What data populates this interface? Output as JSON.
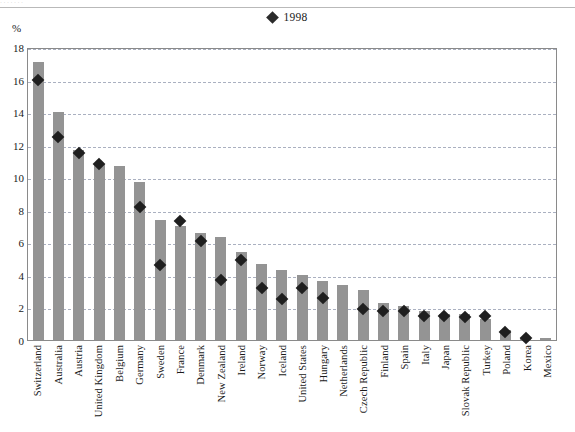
{
  "page": {
    "scan_ghost_text": "·  ·                ·                         ·                          ·              ·          ·"
  },
  "legend": {
    "marker_icon": "diamond-marker-icon",
    "label": "1998"
  },
  "axis": {
    "unit_label": "%"
  },
  "chart_data": {
    "type": "bar",
    "title": "",
    "subtitle": "",
    "xlabel": "",
    "ylabel": "%",
    "ylim": [
      0,
      18
    ],
    "yticks": [
      0,
      2,
      4,
      6,
      8,
      10,
      12,
      14,
      16,
      18
    ],
    "grid": true,
    "legend_position": "top-center",
    "categories": [
      "Switzerland",
      "Australia",
      "Austria",
      "United Kingdom",
      "Belgium",
      "Germany",
      "Sweden",
      "France",
      "Denmark",
      "New Zealand",
      "Ireland",
      "Norway",
      "Iceland",
      "United States",
      "Hungary",
      "Netherlands",
      "Czech Republic",
      "Finland",
      "Spain",
      "Italy",
      "Japan",
      "Slovak Republic",
      "Turkey",
      "Poland",
      "Korea",
      "Mexico"
    ],
    "series": [
      {
        "name": "bars",
        "type": "bar",
        "values": [
          17.1,
          14.0,
          11.7,
          10.8,
          10.7,
          9.7,
          7.4,
          7.0,
          6.6,
          6.3,
          5.4,
          4.7,
          4.3,
          4.0,
          3.6,
          3.4,
          3.1,
          2.3,
          2.1,
          1.8,
          1.6,
          1.6,
          1.3,
          0.6,
          0.15,
          0.1
        ]
      },
      {
        "name": "1998",
        "type": "scatter",
        "marker": "diamond",
        "values": [
          16.0,
          12.5,
          11.5,
          10.8,
          null,
          8.2,
          4.6,
          7.3,
          6.1,
          3.7,
          4.9,
          3.2,
          2.5,
          3.2,
          2.6,
          null,
          1.9,
          1.8,
          1.8,
          1.5,
          1.5,
          1.4,
          1.5,
          0.5,
          0.1,
          null
        ]
      }
    ]
  },
  "colors": {
    "bar_fill": "#949494",
    "marker_fill": "#1f1f1f",
    "gridline": "#aab0c0",
    "plot_border": "#8a8a8a"
  }
}
